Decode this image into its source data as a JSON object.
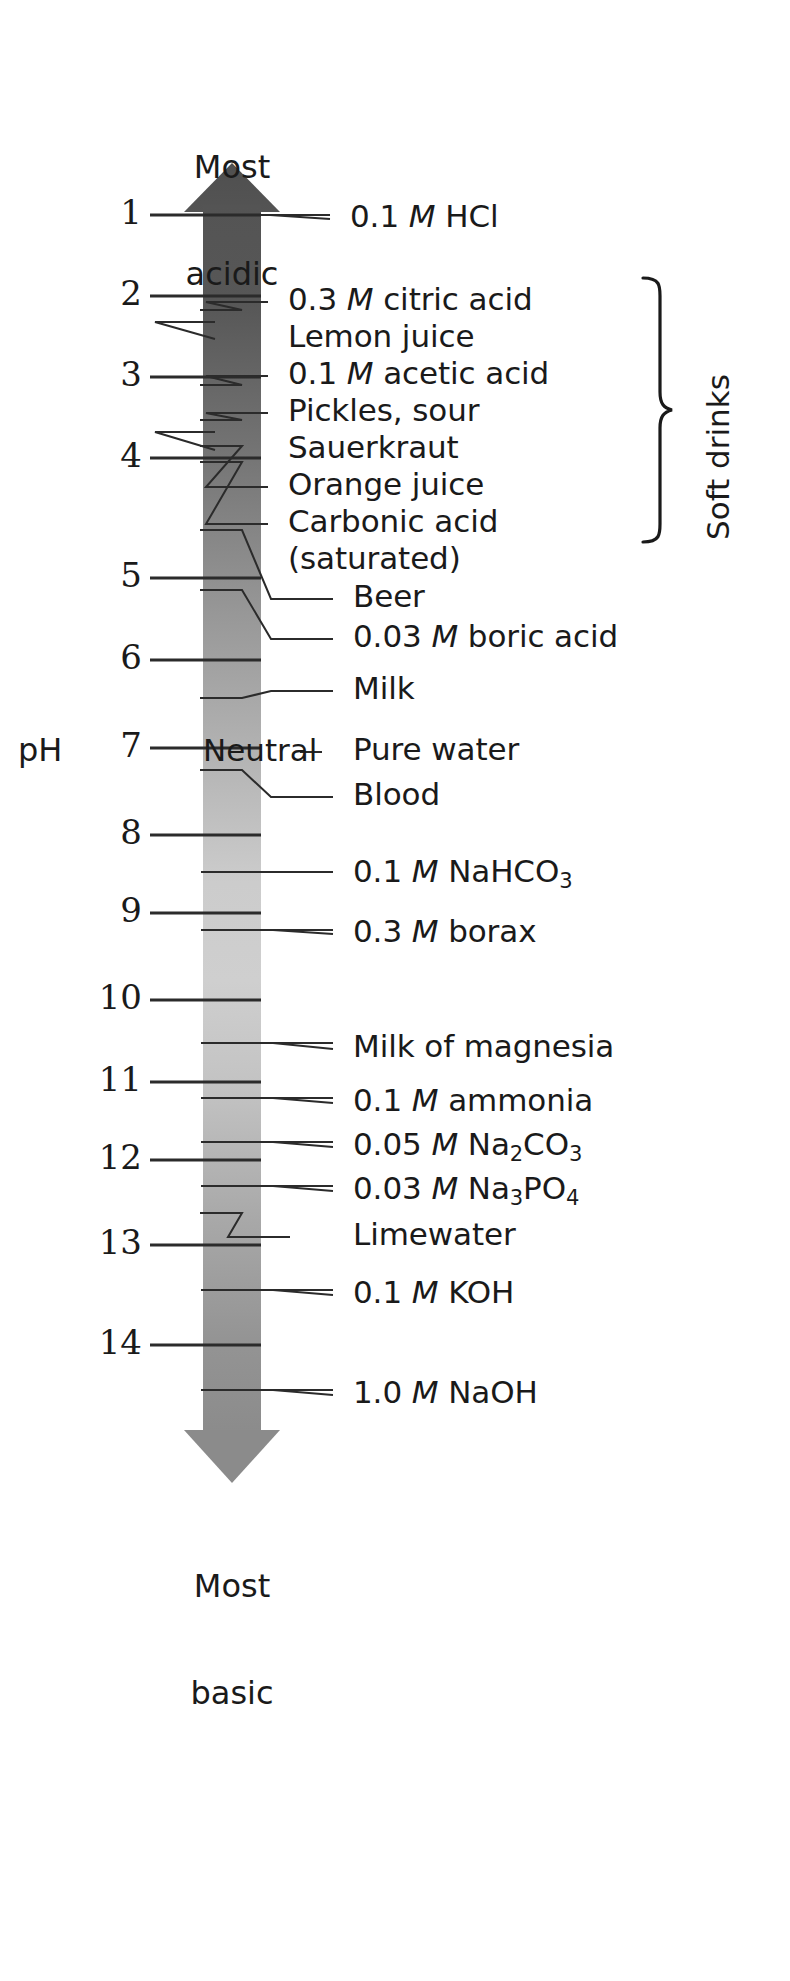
{
  "axis": {
    "name": "pH",
    "top_caption_line1": "Most",
    "top_caption_line2": "acidic",
    "bottom_caption_line1": "Most",
    "bottom_caption_line2": "basic",
    "neutral_label": "Neutral",
    "ticks": [
      {
        "value": "1",
        "y": 215
      },
      {
        "value": "2",
        "y": 296
      },
      {
        "value": "3",
        "y": 377
      },
      {
        "value": "4",
        "y": 458
      },
      {
        "value": "5",
        "y": 578
      },
      {
        "value": "6",
        "y": 660
      },
      {
        "value": "7",
        "y": 748
      },
      {
        "value": "8",
        "y": 835
      },
      {
        "value": "9",
        "y": 913
      },
      {
        "value": "10",
        "y": 1000
      },
      {
        "value": "11",
        "y": 1082
      },
      {
        "value": "12",
        "y": 1160
      },
      {
        "value": "13",
        "y": 1245
      },
      {
        "value": "14",
        "y": 1345
      }
    ],
    "range_min": 1,
    "range_max": 14,
    "colors": {
      "bar_top": "#4d4d4d",
      "bar_mid": "#d0d0d0",
      "bar_bottom": "#8a8a8a",
      "line": "#2b2b2b",
      "text": "#1a1a1a",
      "background": "#ffffff"
    }
  },
  "group": {
    "label": "Soft drinks",
    "brace_top_item": "0.3 M citric acid",
    "brace_bottom_item": "Carbonic acid (saturated)"
  },
  "chart_data": {
    "type": "scatter",
    "xlabel": "",
    "ylabel": "pH",
    "ylim": [
      1,
      14
    ],
    "grid": false,
    "legend": "none",
    "axis_ticks": [
      "1",
      "2",
      "3",
      "4",
      "5",
      "6",
      "7",
      "8",
      "9",
      "10",
      "11",
      "12",
      "13",
      "14"
    ],
    "annotations": [
      "Most acidic",
      "Most basic",
      "Neutral",
      "Soft drinks"
    ],
    "categories": [
      "0.1 M HCl",
      "0.3 M citric acid",
      "Lemon juice",
      "0.1 M acetic acid",
      "Pickles, sour",
      "Sauerkraut",
      "Orange juice",
      "Carbonic acid (saturated)",
      "Beer",
      "0.03 M boric acid",
      "Milk",
      "Pure water",
      "Blood",
      "0.1 M NaHCO3",
      "0.3 M borax",
      "Milk of magnesia",
      "0.1 M ammonia",
      "0.05 M Na2CO3",
      "0.03 M Na3PO4",
      "Limewater",
      "0.1 M KOH",
      "1.0 M NaOH"
    ],
    "values": [
      1.0,
      2.1,
      2.3,
      2.9,
      3.3,
      3.5,
      3.8,
      4.0,
      4.6,
      5.2,
      6.4,
      7.0,
      7.4,
      8.4,
      9.2,
      10.5,
      11.1,
      11.6,
      12.0,
      12.4,
      13.0,
      14.0
    ]
  },
  "substances": [
    {
      "id": "hcl",
      "text_html": "0.1 <i>M</i> HCl",
      "tick_y": 215,
      "text_y": 200,
      "text_x": 350,
      "stub_x": 330,
      "lead_from_x": 200,
      "kind": "straight"
    },
    {
      "id": "citric",
      "text_html": "0.3 <i>M</i> citric acid",
      "tick_y": 310,
      "text_y": 283,
      "text_x": 288,
      "stub_x": 268,
      "lead_from_x": 200,
      "kind": "dogleg"
    },
    {
      "id": "lemon",
      "text_html": "Lemon juice",
      "tick_y": 322,
      "text_y": 320,
      "text_x": 288,
      "stub_x": 215,
      "lead_from_x": 200,
      "kind": "straight"
    },
    {
      "id": "acetic",
      "text_html": "0.1 <i>M</i> acetic acid",
      "tick_y": 385,
      "text_y": 357,
      "text_x": 288,
      "stub_x": 268,
      "lead_from_x": 200,
      "kind": "dogleg"
    },
    {
      "id": "pickles",
      "text_html": "Pickles, sour",
      "tick_y": 420,
      "text_y": 394,
      "text_x": 288,
      "stub_x": 268,
      "lead_from_x": 200,
      "kind": "dogleg"
    },
    {
      "id": "sauerkraut",
      "text_html": "Sauerkraut",
      "tick_y": 432,
      "text_y": 431,
      "text_x": 288,
      "stub_x": 215,
      "lead_from_x": 200,
      "kind": "straight"
    },
    {
      "id": "orange",
      "text_html": "Orange juice",
      "tick_y": 446,
      "text_y": 468,
      "text_x": 288,
      "stub_x": 268,
      "lead_from_x": 200,
      "kind": "dogleg"
    },
    {
      "id": "carbonic",
      "text_html": "Carbonic acid",
      "tick_y": 462,
      "text_y": 505,
      "text_x": 288,
      "stub_x": 268,
      "lead_from_x": 200,
      "kind": "dogleg"
    },
    {
      "id": "carbonic2",
      "text_html": "(saturated)",
      "tick_y": null,
      "text_y": 542,
      "text_x": 288,
      "stub_x": null,
      "lead_from_x": null,
      "kind": "none"
    },
    {
      "id": "beer",
      "text_html": "Beer",
      "tick_y": 530,
      "text_y": 580,
      "text_x": 353,
      "stub_x": 333,
      "lead_from_x": 200,
      "kind": "dogleg"
    },
    {
      "id": "boric",
      "text_html": "0.03 <i>M</i> boric acid",
      "tick_y": 590,
      "text_y": 620,
      "text_x": 353,
      "stub_x": 333,
      "lead_from_x": 200,
      "kind": "dogleg"
    },
    {
      "id": "milk",
      "text_html": "Milk",
      "tick_y": 698,
      "text_y": 672,
      "text_x": 353,
      "stub_x": 333,
      "lead_from_x": 200,
      "kind": "dogleg"
    },
    {
      "id": "purewater",
      "text_html": "Pure water",
      "tick_y": 748,
      "text_y": 733,
      "text_x": 353,
      "stub_x": 322,
      "lead_from_x": 300,
      "kind": "neutral"
    },
    {
      "id": "blood",
      "text_html": "Blood",
      "tick_y": 770,
      "text_y": 778,
      "text_x": 353,
      "stub_x": 333,
      "lead_from_x": 200,
      "kind": "dogleg"
    },
    {
      "id": "nahco3",
      "text_html": "0.1 <i>M</i> NaHCO<sub>3</sub>",
      "tick_y": 872,
      "text_y": 855,
      "text_x": 353,
      "stub_x": 333,
      "lead_from_x": 200,
      "kind": "straight"
    },
    {
      "id": "borax",
      "text_html": "0.3 <i>M</i> borax",
      "tick_y": 930,
      "text_y": 915,
      "text_x": 353,
      "stub_x": 333,
      "lead_from_x": 200,
      "kind": "straight"
    },
    {
      "id": "magnesia",
      "text_html": "Milk of magnesia",
      "tick_y": 1043,
      "text_y": 1030,
      "text_x": 353,
      "stub_x": 333,
      "lead_from_x": 200,
      "kind": "straight"
    },
    {
      "id": "ammonia",
      "text_html": "0.1 <i>M</i> ammonia",
      "tick_y": 1098,
      "text_y": 1084,
      "text_x": 353,
      "stub_x": 333,
      "lead_from_x": 200,
      "kind": "straight"
    },
    {
      "id": "na2co3",
      "text_html": "0.05 <i>M</i> Na<sub>2</sub>CO<sub>3</sub>",
      "tick_y": 1142,
      "text_y": 1128,
      "text_x": 353,
      "stub_x": 333,
      "lead_from_x": 200,
      "kind": "straight"
    },
    {
      "id": "na3po4",
      "text_html": "0.03 <i>M</i> Na<sub>3</sub>PO<sub>4</sub>",
      "tick_y": 1186,
      "text_y": 1172,
      "text_x": 353,
      "stub_x": 333,
      "lead_from_x": 200,
      "kind": "straight"
    },
    {
      "id": "limewater",
      "text_html": "Limewater",
      "tick_y": 1213,
      "text_y": 1218,
      "text_x": 353,
      "stub_x": 290,
      "lead_from_x": 200,
      "kind": "dogleg"
    },
    {
      "id": "koh",
      "text_html": "0.1 <i>M</i> KOH",
      "tick_y": 1290,
      "text_y": 1276,
      "text_x": 353,
      "stub_x": 333,
      "lead_from_x": 200,
      "kind": "straight"
    },
    {
      "id": "naoh",
      "text_html": "1.0 <i>M</i> NaOH",
      "tick_y": 1390,
      "text_y": 1376,
      "text_x": 353,
      "stub_x": 333,
      "lead_from_x": 200,
      "kind": "straight"
    }
  ]
}
